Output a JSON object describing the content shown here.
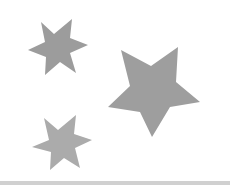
{
  "image": {
    "width": 230,
    "height": 185,
    "background": "#ffffff"
  },
  "shapes": [
    {
      "name": "six-point-star-top",
      "type": "six-point-star",
      "color": "#9c9c9c",
      "points": "41,22 54,34 72,19 70,38 88,45 70,53 76,73 60,62 45,75 46,57 28,50 45,42"
    },
    {
      "name": "five-point-star-large",
      "type": "five-point-star",
      "color": "#9e9e9e",
      "points": "121,50 151,66 178,47 176,82 200,102 170,107 152,137 140,112 108,107 130,86"
    },
    {
      "name": "six-point-star-bottom",
      "type": "six-point-star",
      "color": "#ababab",
      "points": "44,118 58,130 76,115 74,134 92,140 75,148 80,168 64,158 50,170 51,152 32,147 49,140"
    }
  ],
  "bottom_rule": {
    "color": "#d0d0d0"
  }
}
